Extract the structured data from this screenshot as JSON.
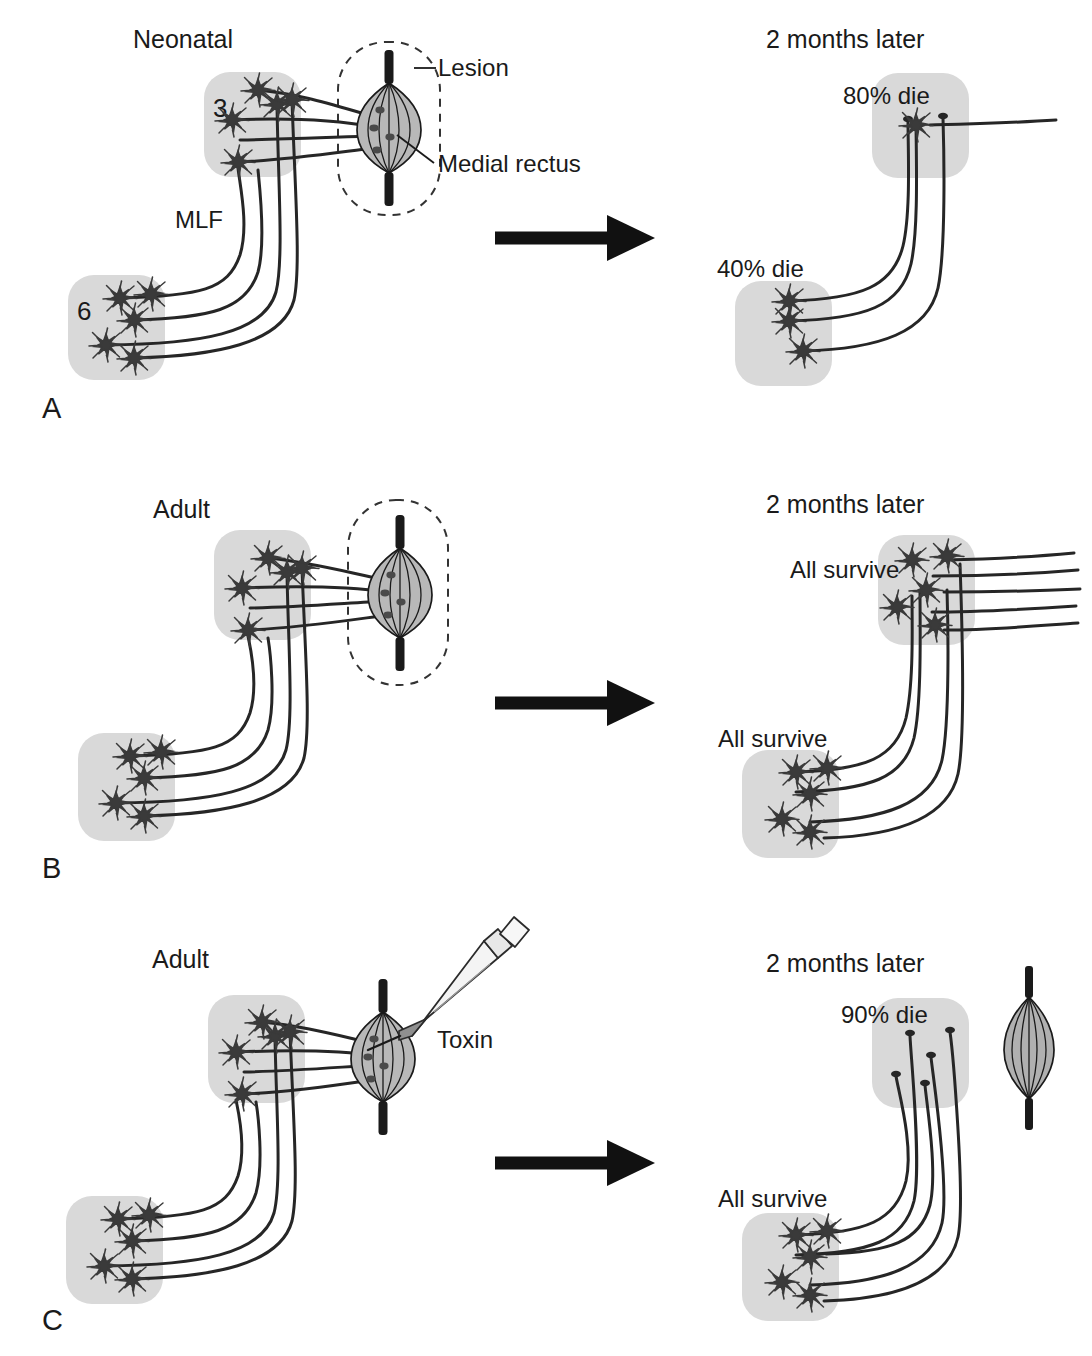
{
  "figure": {
    "title_hidden": "",
    "colors": {
      "nucleus_fill": "#d9d9d9",
      "neuron_fill": "#3a3a3a",
      "axon_stroke": "#262626",
      "text": "#1a1a1a",
      "muscle_fill": "#b8b8b8",
      "tendon": "#1a1a1a",
      "arrow": "#111111",
      "syringe_barrel": "#f2f2f2",
      "syringe_hub": "#9a9a9a",
      "lesion_dash": "#333333"
    },
    "panels": [
      {
        "letter": "A",
        "left": {
          "title": "Neonatal",
          "nucleus_upper_label": "3",
          "nucleus_lower_label": "6",
          "tract_label": "MLF",
          "callout_lesion": "Lesion",
          "callout_muscle": "Medial rectus",
          "muscle_state": "lesioned",
          "upper_neurons": 5,
          "lower_neurons": 5
        },
        "right": {
          "title": "2 months later",
          "upper_label": "80% die",
          "lower_label": "40% die",
          "upper_neurons": 1,
          "upper_stumps": 2,
          "lower_neurons": 3,
          "atrophic_muscle": false
        }
      },
      {
        "letter": "B",
        "left": {
          "title": "Adult",
          "nucleus_upper_label": "",
          "nucleus_lower_label": "",
          "tract_label": "",
          "callout_lesion": "",
          "callout_muscle": "",
          "muscle_state": "lesioned",
          "upper_neurons": 5,
          "lower_neurons": 5
        },
        "right": {
          "title": "2 months later",
          "upper_label": "All survive",
          "lower_label": "All survive",
          "upper_neurons": 5,
          "upper_stumps": 0,
          "lower_neurons": 5,
          "atrophic_muscle": false
        }
      },
      {
        "letter": "C",
        "left": {
          "title": "Adult",
          "nucleus_upper_label": "",
          "nucleus_lower_label": "",
          "tract_label": "",
          "callout_lesion": "",
          "callout_muscle": "",
          "injection_label": "Toxin",
          "muscle_state": "injected",
          "upper_neurons": 5,
          "lower_neurons": 5
        },
        "right": {
          "title": "2 months later",
          "upper_label": "90% die",
          "lower_label": "All survive",
          "upper_neurons": 0,
          "upper_stumps": 5,
          "lower_neurons": 5,
          "atrophic_muscle": true
        }
      }
    ]
  }
}
